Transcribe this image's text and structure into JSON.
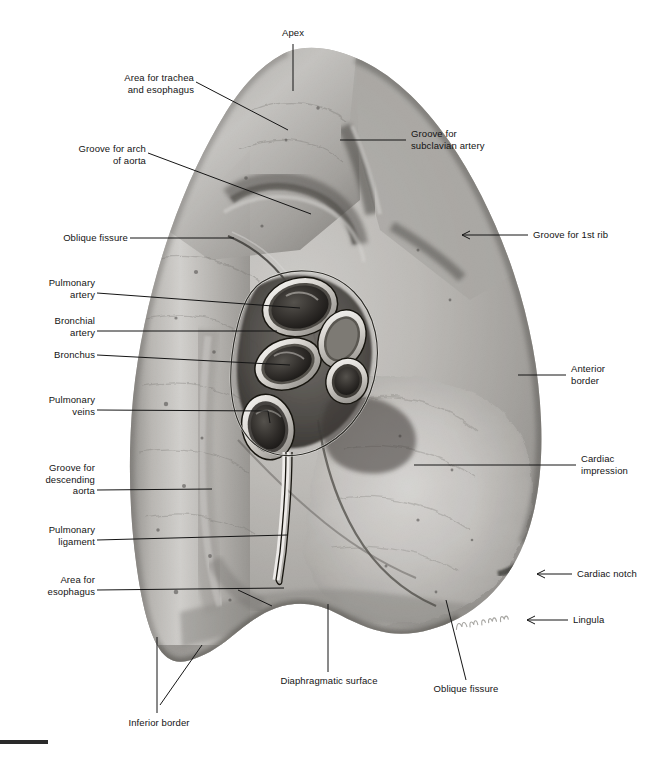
{
  "figure": {
    "background_color": "#ffffff",
    "ink_color": "#131313",
    "signature": "Dcharloh"
  },
  "labels": {
    "apex": "Apex",
    "area_trachea_esophagus": "Area for trachea\nand esophagus",
    "groove_arch_aorta": "Groove for arch\nof aorta",
    "oblique_fissure_upper": "Oblique fissure",
    "pulmonary_artery": "Pulmonary\nartery",
    "bronchial_artery": "Bronchial\nartery",
    "bronchus": "Bronchus",
    "pulmonary_veins": "Pulmonary\nveins",
    "groove_descending_aorta": "Groove for\ndescending\naorta",
    "pulmonary_ligament": "Pulmonary\nligament",
    "area_esophagus": "Area for\nesophagus",
    "groove_subclavian_artery": "Groove for\nsubclavian artery",
    "groove_first_rib": "Groove for 1st rib",
    "anterior_border": "Anterior\nborder",
    "cardiac_impression": "Cardiac\nimpression",
    "cardiac_notch": "Cardiac notch",
    "lingula": "Lingula",
    "inferior_border": "Inferior border",
    "diaphragmatic_surface": "Diaphragmatic surface",
    "oblique_fissure_lower": "Oblique fissure"
  },
  "hilum_structures": [
    "pulmonary artery",
    "bronchial artery",
    "bronchus",
    "pulmonary veins"
  ]
}
